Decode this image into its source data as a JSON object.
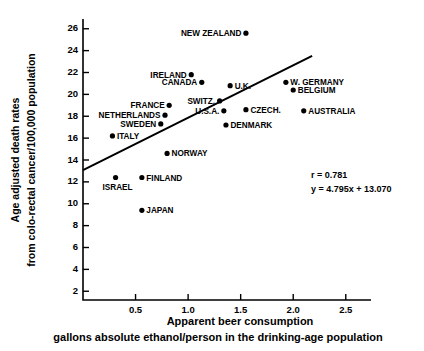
{
  "chart_data": {
    "type": "scatter",
    "title": "",
    "xlabel": "Apparent beer consumption",
    "xlabel_line2": "gallons absolute ethanol/person in the drinking-age population",
    "ylabel": "Age adjusted death rates",
    "ylabel_line2": "from colo-rectal cancer/100,000 population",
    "xlim": [
      0,
      2.74
    ],
    "ylim": [
      1.2,
      26.8
    ],
    "xticks": [
      "0.5",
      "1.0",
      "1.5",
      "2.0",
      "2.5"
    ],
    "xtick_values": [
      0.5,
      1.0,
      1.5,
      2.0,
      2.5
    ],
    "yticks": [
      "2",
      "4",
      "6",
      "8",
      "10",
      "12",
      "14",
      "16",
      "18",
      "20",
      "22",
      "24",
      "26"
    ],
    "ytick_values": [
      2,
      4,
      6,
      8,
      10,
      12,
      14,
      16,
      18,
      20,
      22,
      24,
      26
    ],
    "grid": false,
    "legend": "none",
    "marker_color": "#000000",
    "line_color": "#000000",
    "points": [
      {
        "label": "NEW ZEALAND",
        "x": 1.55,
        "y": 25.6,
        "label_side": "left"
      },
      {
        "label": "IRELAND",
        "x": 1.03,
        "y": 21.8,
        "label_side": "left"
      },
      {
        "label": "CANADA",
        "x": 1.13,
        "y": 21.1,
        "label_side": "left"
      },
      {
        "label": "U.K.",
        "x": 1.4,
        "y": 20.8,
        "label_side": "right"
      },
      {
        "label": "W. GERMANY",
        "x": 1.93,
        "y": 21.1,
        "label_side": "right"
      },
      {
        "label": "BELGIUM",
        "x": 2.0,
        "y": 20.4,
        "label_side": "right"
      },
      {
        "label": "SWITZ.",
        "x": 1.3,
        "y": 19.4,
        "label_side": "left"
      },
      {
        "label": "FRANCE",
        "x": 0.82,
        "y": 19.0,
        "label_side": "left"
      },
      {
        "label": "U.S.A.",
        "x": 1.34,
        "y": 18.5,
        "label_side": "left"
      },
      {
        "label": "CZECH.",
        "x": 1.55,
        "y": 18.6,
        "label_side": "right"
      },
      {
        "label": "AUSTRALIA",
        "x": 2.1,
        "y": 18.5,
        "label_side": "right"
      },
      {
        "label": "NETHERLANDS",
        "x": 0.78,
        "y": 18.1,
        "label_side": "left"
      },
      {
        "label": "SWEDEN",
        "x": 0.74,
        "y": 17.3,
        "label_side": "left"
      },
      {
        "label": "ITALY",
        "x": 0.28,
        "y": 16.2,
        "label_side": "right"
      },
      {
        "label": "DENMARK",
        "x": 1.36,
        "y": 17.2,
        "label_side": "right"
      },
      {
        "label": "NORWAY",
        "x": 0.8,
        "y": 14.6,
        "label_side": "right"
      },
      {
        "label": "FINLAND",
        "x": 0.56,
        "y": 12.4,
        "label_side": "right"
      },
      {
        "label": "ISRAEL",
        "x": 0.31,
        "y": 12.4,
        "label_side": "below"
      },
      {
        "label": "JAPAN",
        "x": 0.56,
        "y": 9.4,
        "label_side": "right"
      }
    ],
    "fit": {
      "slope": 4.795,
      "intercept": 13.07,
      "r": 0.781,
      "x_start": 0.0,
      "x_end": 2.18,
      "r_text": "r = 0.781",
      "equation_text": "y = 4.795x + 13.070"
    }
  }
}
